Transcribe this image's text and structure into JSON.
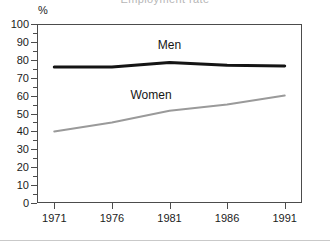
{
  "figure": {
    "unit_label": "%",
    "title_remnant": "Employment rate"
  },
  "chart_data": {
    "type": "line",
    "title": "",
    "xlabel": "",
    "ylabel": "%",
    "x": [
      1971,
      1976,
      1981,
      1986,
      1991
    ],
    "categories": [
      "1971",
      "1976",
      "1981",
      "1986",
      "1991"
    ],
    "xlim": [
      1969.5,
      1992.5
    ],
    "ylim": [
      0,
      100
    ],
    "yticks": [
      0,
      10,
      20,
      30,
      40,
      50,
      60,
      70,
      80,
      90,
      100
    ],
    "ytick_labels": [
      "0",
      "10",
      "20",
      "30",
      "40",
      "50",
      "60",
      "70",
      "80",
      "90",
      "100"
    ],
    "ytick_minor_step": 5,
    "xticks": [
      1971,
      1976,
      1981,
      1986,
      1991
    ],
    "xtick_labels": [
      "1971",
      "1976",
      "1981",
      "1986",
      "1991"
    ],
    "grid": false,
    "legend": "inline-labels",
    "series": [
      {
        "name": "Men",
        "label": "Men",
        "color": "#141414",
        "width": 3,
        "values": [
          76,
          76,
          78.5,
          77,
          76.5
        ],
        "label_x": 1981,
        "label_y": 88
      },
      {
        "name": "Women",
        "label": "Women",
        "color": "#9a9a9a",
        "width": 2,
        "values": [
          40,
          45,
          51.5,
          55,
          60
        ],
        "label_x": 1979.4,
        "label_y": 60.5
      }
    ]
  }
}
